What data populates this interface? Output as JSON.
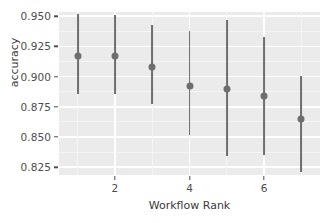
{
  "chart_data": {
    "type": "scatter",
    "title": "",
    "xlabel": "Workflow Rank",
    "ylabel": "accuracy",
    "xlim": [
      0.5,
      7.5
    ],
    "ylim": [
      0.8185,
      0.9535
    ],
    "grid": true,
    "legend": null,
    "x_ticks": [
      2,
      4,
      6
    ],
    "x_tick_labels": [
      "2",
      "4",
      "6"
    ],
    "y_ticks": [
      0.825,
      0.85,
      0.875,
      0.9,
      0.925,
      0.95
    ],
    "y_tick_labels": [
      "0.825",
      "0.850",
      "0.875",
      "0.900",
      "0.925",
      "0.950"
    ],
    "y_minor_ticks": [
      0.8375,
      0.8625,
      0.8875,
      0.9125,
      0.9375
    ],
    "x_minor_ticks": [
      1,
      3,
      5,
      7
    ],
    "point_color": "#6E6E6E",
    "panel_color": "#EBEBEB",
    "gridline_color": "#FFFFFF",
    "error_type": "confidence interval",
    "x": [
      1,
      2,
      3,
      4,
      5,
      6,
      7
    ],
    "values": [
      0.917,
      0.917,
      0.908,
      0.892,
      0.89,
      0.884,
      0.865
    ],
    "error_low": [
      0.8855,
      0.8855,
      0.8775,
      0.8515,
      0.8343,
      0.8351,
      0.8212
    ],
    "error_high": [
      0.9516,
      0.951,
      0.9424,
      0.9378,
      0.9467,
      0.9332,
      0.9005
    ],
    "series": [
      {
        "name": "accuracy",
        "points": [
          {
            "x": 1,
            "y": 0.917,
            "low": 0.8855,
            "high": 0.9516
          },
          {
            "x": 2,
            "y": 0.917,
            "low": 0.8855,
            "high": 0.951
          },
          {
            "x": 3,
            "y": 0.908,
            "low": 0.8775,
            "high": 0.9424
          },
          {
            "x": 4,
            "y": 0.892,
            "low": 0.8515,
            "high": 0.9378
          },
          {
            "x": 5,
            "y": 0.89,
            "low": 0.8343,
            "high": 0.9467
          },
          {
            "x": 6,
            "y": 0.884,
            "low": 0.8351,
            "high": 0.9332
          },
          {
            "x": 7,
            "y": 0.865,
            "low": 0.8212,
            "high": 0.9005
          }
        ]
      }
    ]
  }
}
